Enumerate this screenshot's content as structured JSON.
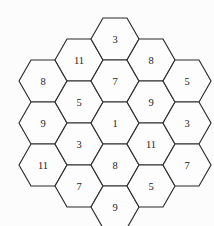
{
  "board": {
    "title": "Hexagon Number Puzzle",
    "shape": "hexagon-of-hexagons",
    "orientation": "flat-top",
    "cell_count": 19,
    "columns": 5,
    "column_sizes": [
      3,
      4,
      5,
      4,
      3
    ],
    "colors": {
      "background": "#fcfcfc",
      "cell_fill": "#fdfdfd",
      "cell_stroke": "#2b2b2b",
      "label": "#1c1c1c"
    },
    "geometry": {
      "left": 19,
      "top": 18,
      "right": 198,
      "bottom": 207,
      "hex_width": 48,
      "hex_height": 42,
      "col_step_x": 36,
      "col_step_y": 21
    },
    "cells": [
      {
        "id": "c0r0",
        "col": 0,
        "row": 0,
        "cx": 43,
        "cy": 81,
        "value": "8"
      },
      {
        "id": "c0r1",
        "col": 0,
        "row": 1,
        "cx": 43,
        "cy": 123,
        "value": "9"
      },
      {
        "id": "c0r2",
        "col": 0,
        "row": 2,
        "cx": 43,
        "cy": 165,
        "value": "11"
      },
      {
        "id": "c1r0",
        "col": 1,
        "row": 0,
        "cx": 79,
        "cy": 60,
        "value": "11"
      },
      {
        "id": "c1r1",
        "col": 1,
        "row": 1,
        "cx": 79,
        "cy": 102,
        "value": "5"
      },
      {
        "id": "c1r2",
        "col": 1,
        "row": 2,
        "cx": 79,
        "cy": 144,
        "value": "3"
      },
      {
        "id": "c1r3",
        "col": 1,
        "row": 3,
        "cx": 79,
        "cy": 186,
        "value": "7"
      },
      {
        "id": "c2r0",
        "col": 2,
        "row": 0,
        "cx": 115,
        "cy": 39,
        "value": "3"
      },
      {
        "id": "c2r1",
        "col": 2,
        "row": 1,
        "cx": 115,
        "cy": 81,
        "value": "7"
      },
      {
        "id": "c2r2",
        "col": 2,
        "row": 2,
        "cx": 115,
        "cy": 123,
        "value": "1"
      },
      {
        "id": "c2r3",
        "col": 2,
        "row": 3,
        "cx": 115,
        "cy": 165,
        "value": "8"
      },
      {
        "id": "c2r4",
        "col": 2,
        "row": 4,
        "cx": 115,
        "cy": 207,
        "value": "9"
      },
      {
        "id": "c3r0",
        "col": 3,
        "row": 0,
        "cx": 151,
        "cy": 60,
        "value": "8"
      },
      {
        "id": "c3r1",
        "col": 3,
        "row": 1,
        "cx": 151,
        "cy": 102,
        "value": "9"
      },
      {
        "id": "c3r2",
        "col": 3,
        "row": 2,
        "cx": 151,
        "cy": 144,
        "value": "11"
      },
      {
        "id": "c3r3",
        "col": 3,
        "row": 3,
        "cx": 151,
        "cy": 186,
        "value": "5"
      },
      {
        "id": "c4r0",
        "col": 4,
        "row": 0,
        "cx": 187,
        "cy": 81,
        "value": "5"
      },
      {
        "id": "c4r1",
        "col": 4,
        "row": 1,
        "cx": 187,
        "cy": 123,
        "value": "3"
      },
      {
        "id": "c4r2",
        "col": 4,
        "row": 2,
        "cx": 187,
        "cy": 165,
        "value": "7"
      }
    ]
  }
}
